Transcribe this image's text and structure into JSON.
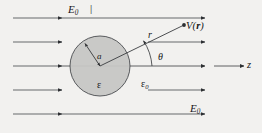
{
  "figure": {
    "kind": "physics-diagram",
    "background_color": "#f2f1ef",
    "line_color": "#3a3c3f",
    "sphere": {
      "fill_color": "#c6c6c4",
      "stroke_color": "#4a4c4f",
      "center_x": 100,
      "center_y": 66,
      "radius": 30
    },
    "labels": {
      "field_top": "E",
      "field_top_sub": "0",
      "field_top_tick": "|",
      "field_bottom": "E",
      "field_bottom_sub": "0",
      "potential": "V(",
      "potential_vector": "r",
      "potential_close": ")",
      "radius_vector": "r",
      "angle": "θ",
      "sphere_radius": "a",
      "permittivity_inside": "ε",
      "permittivity_outside": "ε",
      "permittivity_outside_sub": "0",
      "axis": "z"
    },
    "field_lines": {
      "count_left": 5,
      "count_right": 5,
      "rows_y": [
        18,
        42,
        66,
        90,
        114
      ],
      "direction": "left-to-right"
    }
  }
}
